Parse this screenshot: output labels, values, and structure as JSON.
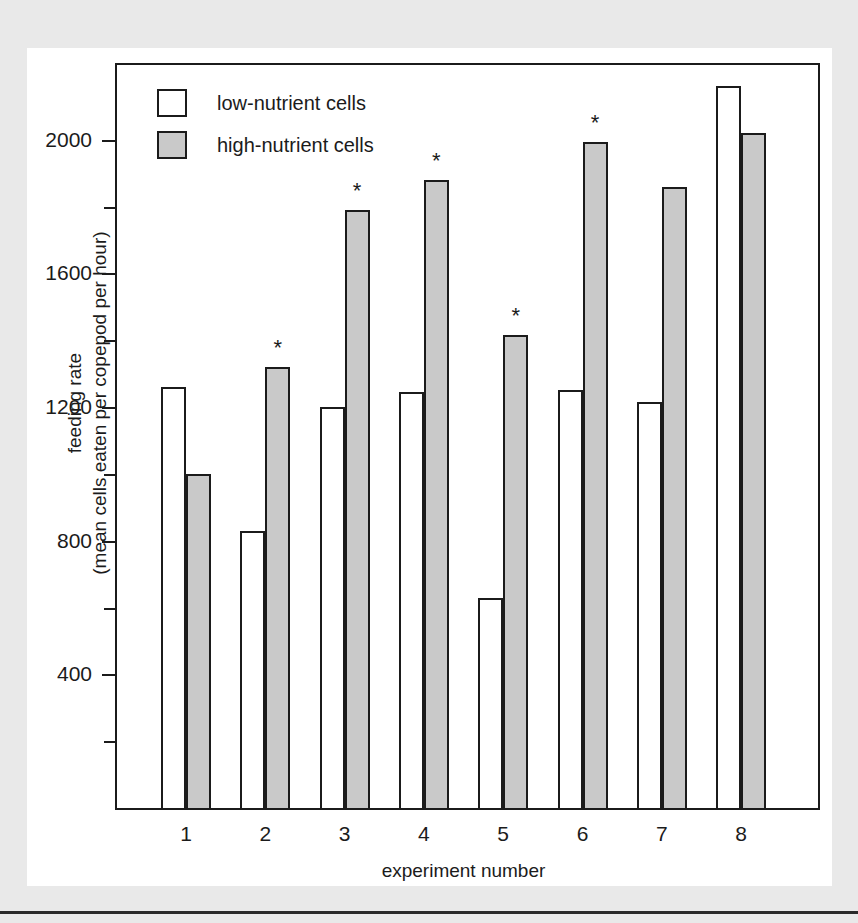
{
  "chart_data": {
    "type": "bar",
    "title": "",
    "xlabel": "experiment number",
    "ylabel": "feeding rate (mean cells eaten per copepod per hour)",
    "ylabel_lines": [
      "feeding rate",
      "(mean cells eaten per copepod per hour)"
    ],
    "categories": [
      "1",
      "2",
      "3",
      "4",
      "5",
      "6",
      "7",
      "8"
    ],
    "series": [
      {
        "name": "low-nutrient cells",
        "color": "#ffffff",
        "values": [
          1260,
          830,
          1200,
          1245,
          630,
          1250,
          1215,
          2160
        ]
      },
      {
        "name": "high-nutrient cells",
        "color": "#c9c9c9",
        "values": [
          1000,
          1320,
          1790,
          1880,
          1415,
          1995,
          1860,
          2020
        ]
      }
    ],
    "annotations": [
      {
        "category": "2",
        "series": "high-nutrient cells",
        "marker": "*"
      },
      {
        "category": "3",
        "series": "high-nutrient cells",
        "marker": "*"
      },
      {
        "category": "4",
        "series": "high-nutrient cells",
        "marker": "*"
      },
      {
        "category": "5",
        "series": "high-nutrient cells",
        "marker": "*"
      },
      {
        "category": "6",
        "series": "high-nutrient cells",
        "marker": "*"
      }
    ],
    "ylim": [
      0,
      2230
    ],
    "y_major_ticks": [
      400,
      800,
      1200,
      1600,
      2000
    ],
    "y_minor_ticks": [
      200,
      600,
      1000,
      1400,
      1800
    ],
    "y_tick_labels": [
      "400",
      "800",
      "1200",
      "1600",
      "2000"
    ],
    "grid": false,
    "legend_position": "top-left",
    "axis_color": "#1b1b1b",
    "background_color": "#ffffff",
    "page_background_color": "#e9e9e9"
  },
  "legend": {
    "entries": [
      {
        "label": "low-nutrient cells",
        "swatch": "white-square-swatch"
      },
      {
        "label": "high-nutrient cells",
        "swatch": "gray-square-swatch"
      }
    ]
  },
  "axes": {
    "y_title_line1": "feeding rate",
    "y_title_line2": "(mean cells eaten per copepod per hour)",
    "x_title": "experiment number"
  }
}
